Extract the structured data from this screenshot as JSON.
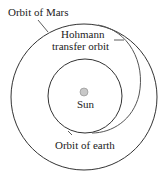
{
  "diagram": {
    "labels": {
      "mars_orbit": "Orbit of Mars",
      "transfer_line1": "Hohmann",
      "transfer_line2": "transfer orbit",
      "sun": "Sun",
      "earth_orbit": "Orbit of earth"
    },
    "colors": {
      "line": "#333333",
      "sun_fill": "#c8c8c8",
      "background": "#ffffff"
    }
  }
}
